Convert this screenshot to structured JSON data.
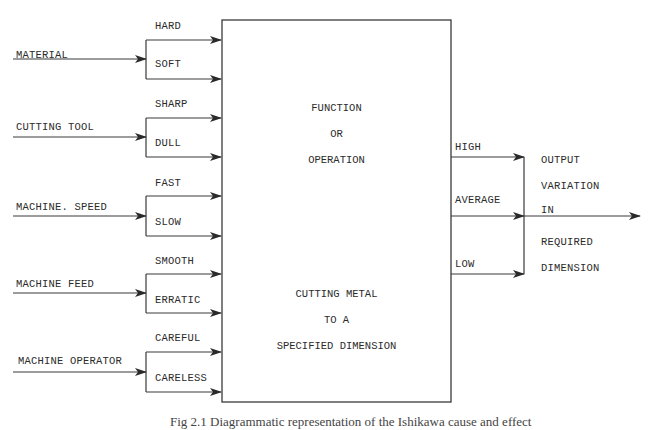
{
  "figure": {
    "caption": "Fig 2.1   Diagrammatic representation of the Ishikawa cause and effect"
  },
  "inputs": [
    {
      "label": "MATERIAL",
      "options": [
        "HARD",
        "SOFT"
      ]
    },
    {
      "label": "CUTTING TOOL",
      "options": [
        "SHARP",
        "DULL"
      ]
    },
    {
      "label": "MACHINE. SPEED",
      "options": [
        "FAST",
        "SLOW"
      ]
    },
    {
      "label": "MACHINE FEED",
      "options": [
        "SMOOTH",
        "ERRATIC"
      ]
    },
    {
      "label": "MACHINE OPERATOR",
      "options": [
        "CAREFUL",
        "CARELESS"
      ]
    }
  ],
  "process": {
    "title_lines": [
      "FUNCTION",
      "OR",
      "OPERATION"
    ],
    "description_lines": [
      "CUTTING METAL",
      "TO A",
      "SPECIFIED DIMENSION"
    ]
  },
  "outputs": {
    "levels": [
      "HIGH",
      "AVERAGE",
      "LOW"
    ],
    "result_lines": [
      "OUTPUT",
      "VARIATION",
      "IN",
      "REQUIRED",
      "DIMENSION"
    ]
  },
  "colors": {
    "line": "#3a3a3a",
    "text": "#2b2b2b",
    "background": "#ffffff"
  }
}
